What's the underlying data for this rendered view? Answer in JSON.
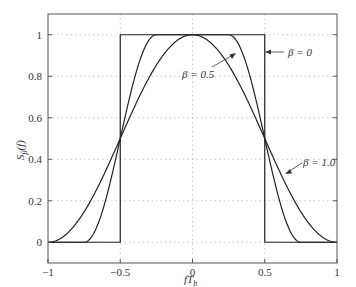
{
  "chart_data": {
    "type": "line",
    "title": "",
    "xlabel": "fT_b",
    "ylabel": "S_β(f)",
    "xlim": [
      -1,
      1
    ],
    "ylim": [
      -0.1,
      1.1
    ],
    "xticks": [
      "-1",
      "-0.5",
      "0",
      "0.5",
      "1"
    ],
    "yticks": [
      "0",
      "0.2",
      "0.4",
      "0.6",
      "0.8",
      "1"
    ],
    "grid": true,
    "legend": "annotations",
    "series": [
      {
        "name": "β=0",
        "description": "rectangular: 1 for |fT_b|<0.5, else 0",
        "x": [
          -1,
          -0.5,
          -0.5,
          0.5,
          0.5,
          1
        ],
        "y": [
          0,
          0,
          1,
          1,
          0,
          0
        ]
      },
      {
        "name": "β=0.5",
        "description": "raised cosine, flat for |fT_b|<=0.25, zero for |fT_b|>=0.75",
        "x": [
          -1,
          -0.75,
          -0.5,
          -0.25,
          0,
          0.25,
          0.5,
          0.75,
          1
        ],
        "y": [
          0,
          0,
          0.5,
          1,
          1,
          1,
          0.5,
          0,
          0
        ]
      },
      {
        "name": "β=1.0",
        "description": "full raised cosine",
        "x": [
          -1,
          -0.75,
          -0.5,
          -0.25,
          0,
          0.25,
          0.5,
          0.75,
          1
        ],
        "y": [
          0,
          0.146,
          0.5,
          0.854,
          1,
          0.854,
          0.5,
          0.146,
          0
        ]
      }
    ],
    "annotations": [
      "β=0",
      "β=0.5",
      "β=1.0"
    ]
  },
  "labels": {
    "xlabel_main": "fT",
    "xlabel_sub": "b",
    "ylabel_main": "S",
    "ylabel_sub": "β",
    "ylabel_tail": "(f)",
    "ann0": "β = 0",
    "ann1": "β = 0.5",
    "ann2": "β = 1.0"
  }
}
